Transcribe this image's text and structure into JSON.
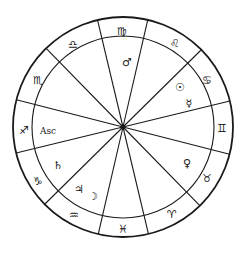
{
  "chart": {
    "type": "astrological-natal-chart",
    "center": [
      123,
      127
    ],
    "outer_radius": 110,
    "inner_radius": 91,
    "hub_radius": 2.5,
    "line_color": "#1a1a1a",
    "spoke_angles_deg": [
      -103.4,
      -77.0,
      -44.6,
      -13.7,
      14.3,
      45.7,
      76.6,
      103.0,
      135.4,
      166.3,
      194.3,
      225.7
    ],
    "signs": [
      {
        "name": "Virgo",
        "glyph": "♍",
        "x": 122,
        "y": 31
      },
      {
        "name": "Leo",
        "glyph": "♌",
        "x": 175,
        "y": 43
      },
      {
        "name": "Cancer",
        "glyph": "♋",
        "x": 207,
        "y": 80
      },
      {
        "name": "Gemini",
        "glyph": "♊",
        "x": 222,
        "y": 128
      },
      {
        "name": "Taurus",
        "glyph": "♉",
        "x": 207,
        "y": 178
      },
      {
        "name": "Aries",
        "glyph": "♈",
        "x": 172,
        "y": 214
      },
      {
        "name": "Pisces",
        "glyph": "♓",
        "x": 123,
        "y": 229
      },
      {
        "name": "Aquarius",
        "glyph": "♒",
        "x": 74,
        "y": 215
      },
      {
        "name": "Capricorn",
        "glyph": "♑",
        "x": 38,
        "y": 181
      },
      {
        "name": "Sagittarius",
        "glyph": "♐",
        "x": 24,
        "y": 130
      },
      {
        "name": "Scorpio",
        "glyph": "♏",
        "x": 38,
        "y": 80
      },
      {
        "name": "Libra",
        "glyph": "♎",
        "x": 73,
        "y": 44
      }
    ],
    "planets": [
      {
        "name": "Mars",
        "glyph": "♂",
        "x": 127,
        "y": 62
      },
      {
        "name": "Sun",
        "glyph": "☉",
        "x": 180,
        "y": 87
      },
      {
        "name": "Mercury",
        "glyph": "☿",
        "x": 189,
        "y": 103
      },
      {
        "name": "Venus",
        "glyph": "♀",
        "x": 187,
        "y": 163
      },
      {
        "name": "Saturn",
        "glyph": "♄",
        "x": 58,
        "y": 165
      },
      {
        "name": "Jupiter",
        "glyph": "♃",
        "x": 79,
        "y": 189
      },
      {
        "name": "Moon",
        "glyph": "☽",
        "x": 93,
        "y": 196
      }
    ],
    "ascendant": {
      "label": "Asc",
      "x": 48,
      "y": 131
    }
  }
}
